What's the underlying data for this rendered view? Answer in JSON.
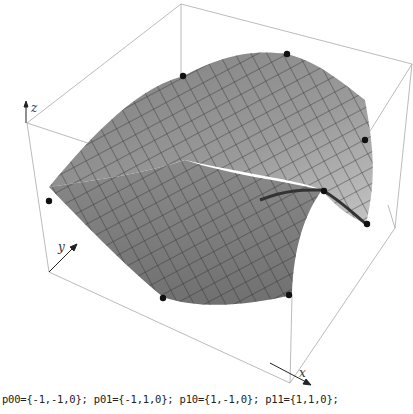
{
  "figure": {
    "type": "3d bilinear/biquadratic surface plot with bounding box",
    "axes": {
      "x_label": "x",
      "y_label": "y",
      "z_label": "z"
    },
    "surface_color": "#8c8c8c",
    "mesh_color": "#2a2a2a",
    "control_points_visible": 8
  },
  "caption": "p00={-1,-1,0}; p01={-1,1,0}; p10={1,-1,0}; p11={1,1,0};"
}
